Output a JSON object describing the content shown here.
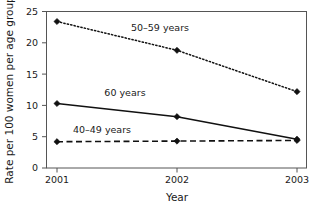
{
  "chart_data": {
    "type": "line",
    "title": "",
    "xlabel": "Year",
    "ylabel": "Rate per 100 women per age group",
    "categories": [
      "2001",
      "2002",
      "2003"
    ],
    "x": [
      2001,
      2002,
      2003
    ],
    "xlim": [
      2001,
      2003
    ],
    "ylim": [
      0,
      25
    ],
    "yticks": [
      "0",
      "5",
      "10",
      "15",
      "20",
      "25"
    ],
    "ytick_values": [
      0,
      5,
      10,
      15,
      20,
      25
    ],
    "grid": false,
    "legend_position": "inline-annotations",
    "series": [
      {
        "name": "50-59 years",
        "label": "50–59 years",
        "values": [
          23.4,
          18.8,
          12.2
        ],
        "line_style": "dotted",
        "marker": "diamond",
        "color": "#111111"
      },
      {
        "name": "60 years",
        "label": "60 years",
        "values": [
          10.3,
          8.2,
          4.6
        ],
        "line_style": "solid",
        "marker": "diamond",
        "color": "#111111"
      },
      {
        "name": "40-49 years",
        "label": "40–49 years",
        "values": [
          4.2,
          4.3,
          4.4
        ],
        "line_style": "dashed",
        "marker": "diamond",
        "color": "#111111"
      }
    ]
  }
}
